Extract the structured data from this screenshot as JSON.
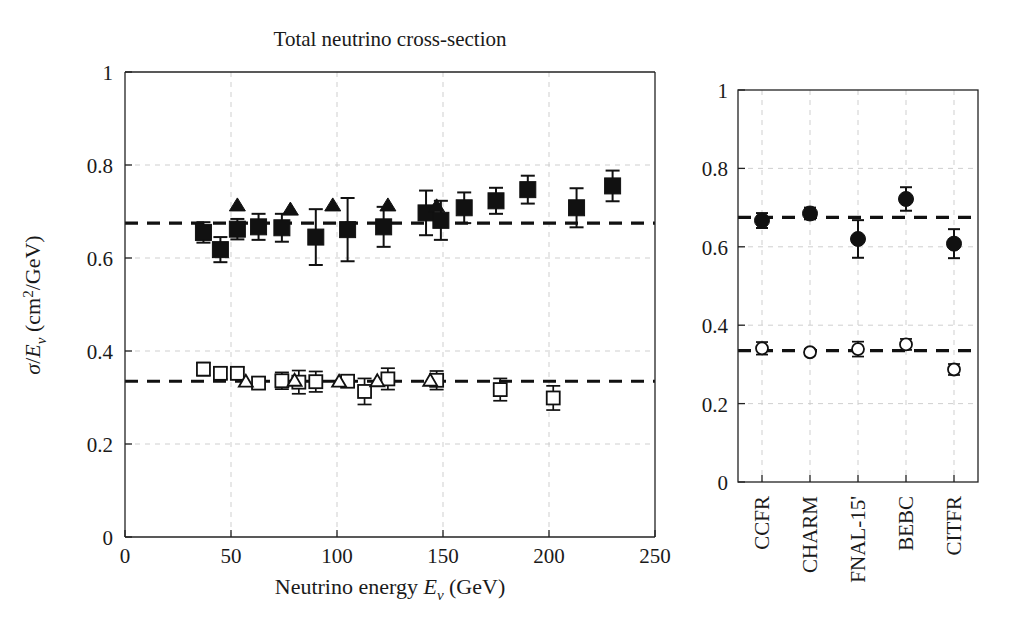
{
  "figure": {
    "title": "Total neutrino cross-section",
    "background": "#ffffff",
    "foreground": "#1a1a1a"
  },
  "chart_data": [
    {
      "id": "main-panel",
      "type": "scatter",
      "title": "Total neutrino cross-section",
      "xlabel": "Neutrino energy Eν (GeV)",
      "ylabel": "σ/Eν (cm²/GeV)",
      "xlabel_parts": {
        "text_before": "Neutrino energy ",
        "symbol": "E",
        "subscript": "ν",
        "text_after": " (GeV)"
      },
      "ylabel_parts": {
        "symbol1": "σ",
        "slash": "/",
        "symbol2": "E",
        "subscript": "ν",
        "unit": " (cm",
        "sup": "2",
        "unit_end": "/GeV)"
      },
      "xlim": [
        0,
        250
      ],
      "ylim": [
        0,
        1
      ],
      "xticks": [
        0,
        50,
        100,
        150,
        200,
        250
      ],
      "xticklabels": [
        "0",
        "50",
        "100",
        "150",
        "200",
        "250"
      ],
      "yticks": [
        0,
        0.2,
        0.4,
        0.6,
        0.8,
        1
      ],
      "yticklabels": [
        "0",
        "0.2",
        "0.4",
        "0.6",
        "0.8",
        "1"
      ],
      "grid": true,
      "legend": "none",
      "reference_lines": [
        {
          "name": "neutrino-mean",
          "y": 0.675,
          "style": "dashed"
        },
        {
          "name": "antineutrino-mean",
          "y": 0.335,
          "style": "dashed"
        }
      ],
      "series": [
        {
          "name": "neutrino-filled-square",
          "marker": "filled-square",
          "points": [
            {
              "x": 37,
              "y": 0.655,
              "yerr": 0.022
            },
            {
              "x": 45,
              "y": 0.618,
              "yerr": 0.027
            },
            {
              "x": 53,
              "y": 0.662,
              "yerr": 0.022
            },
            {
              "x": 63,
              "y": 0.667,
              "yerr": 0.028
            },
            {
              "x": 74,
              "y": 0.665,
              "yerr": 0.03
            },
            {
              "x": 90,
              "y": 0.645,
              "yerr": 0.06
            },
            {
              "x": 105,
              "y": 0.661,
              "yerr": 0.068
            },
            {
              "x": 122,
              "y": 0.667,
              "yerr": 0.043
            },
            {
              "x": 142,
              "y": 0.697,
              "yerr": 0.048
            },
            {
              "x": 149,
              "y": 0.681,
              "yerr": 0.042
            },
            {
              "x": 160,
              "y": 0.708,
              "yerr": 0.033
            },
            {
              "x": 175,
              "y": 0.723,
              "yerr": 0.028
            },
            {
              "x": 190,
              "y": 0.747,
              "yerr": 0.03
            },
            {
              "x": 213,
              "y": 0.708,
              "yerr": 0.042
            },
            {
              "x": 230,
              "y": 0.755,
              "yerr": 0.033
            }
          ]
        },
        {
          "name": "neutrino-filled-triangle",
          "marker": "filled-triangle",
          "points": [
            {
              "x": 53,
              "y": 0.712
            },
            {
              "x": 78,
              "y": 0.703
            },
            {
              "x": 98,
              "y": 0.712
            },
            {
              "x": 124,
              "y": 0.712
            },
            {
              "x": 147,
              "y": 0.71
            }
          ]
        },
        {
          "name": "antineutrino-open-square",
          "marker": "open-square",
          "points": [
            {
              "x": 37,
              "y": 0.361,
              "yerr": 0.014
            },
            {
              "x": 45,
              "y": 0.352,
              "yerr": 0.012
            },
            {
              "x": 53,
              "y": 0.352,
              "yerr": 0.013
            },
            {
              "x": 63,
              "y": 0.331,
              "yerr": 0.012
            },
            {
              "x": 74,
              "y": 0.336,
              "yerr": 0.018
            },
            {
              "x": 82,
              "y": 0.333,
              "yerr": 0.025
            },
            {
              "x": 90,
              "y": 0.334,
              "yerr": 0.022
            },
            {
              "x": 105,
              "y": 0.335,
              "yerr": 0.01
            },
            {
              "x": 113,
              "y": 0.313,
              "yerr": 0.028
            },
            {
              "x": 124,
              "y": 0.34,
              "yerr": 0.023
            },
            {
              "x": 147,
              "y": 0.337,
              "yerr": 0.02
            },
            {
              "x": 177,
              "y": 0.317,
              "yerr": 0.024
            },
            {
              "x": 202,
              "y": 0.299,
              "yerr": 0.026
            }
          ]
        },
        {
          "name": "antineutrino-open-triangle",
          "marker": "open-triangle",
          "points": [
            {
              "x": 57,
              "y": 0.334
            },
            {
              "x": 80,
              "y": 0.336
            },
            {
              "x": 101,
              "y": 0.334
            },
            {
              "x": 119,
              "y": 0.335
            },
            {
              "x": 144,
              "y": 0.336
            }
          ]
        }
      ]
    },
    {
      "id": "experiment-panel",
      "type": "scatter",
      "title": "",
      "xlabel": "",
      "ylabel": "",
      "ylim": [
        0,
        1
      ],
      "yticks": [
        0,
        0.2,
        0.4,
        0.6,
        0.8,
        1
      ],
      "yticklabels": [
        "0",
        "0.2",
        "0.4",
        "0.6",
        "0.8",
        "1"
      ],
      "categories": [
        "CCFR",
        "CHARM",
        "FNAL-15'",
        "BEBC",
        "CITFR"
      ],
      "grid": true,
      "legend": "none",
      "reference_lines": [
        {
          "name": "neutrino-mean",
          "y": 0.675,
          "style": "dashed"
        },
        {
          "name": "antineutrino-mean",
          "y": 0.335,
          "style": "dashed"
        }
      ],
      "series": [
        {
          "name": "neutrino-filled-circle",
          "marker": "filled-circle",
          "values": [
            0.667,
            0.685,
            0.62,
            0.722,
            0.608
          ],
          "errors": [
            0.019,
            0.015,
            0.048,
            0.03,
            0.037
          ]
        },
        {
          "name": "antineutrino-open-circle",
          "marker": "open-circle",
          "values": [
            0.341,
            0.331,
            0.339,
            0.351,
            0.287
          ],
          "errors": [
            0.016,
            0.008,
            0.019,
            0.014,
            0.014
          ]
        }
      ]
    }
  ],
  "colors": {
    "axis": "#222222",
    "grid": "#c9c9c9",
    "marker": "#111111",
    "reference": "#111111",
    "background": "#ffffff"
  }
}
